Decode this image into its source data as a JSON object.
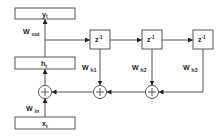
{
  "diagram": {
    "title": "",
    "nodes": {
      "output": {
        "label": "y",
        "sub": "t"
      },
      "hidden": {
        "label": "h",
        "sub": "t"
      },
      "input": {
        "label": "x",
        "sub": "t"
      },
      "delay1": {
        "label": "z",
        "sup": "-1"
      },
      "delay2": {
        "label": "z",
        "sup": "-1"
      },
      "delay3": {
        "label": "z",
        "sup": "-1"
      },
      "sum1": {
        "label": "+"
      },
      "sum2": {
        "label": "+"
      },
      "sum3": {
        "label": "+"
      }
    },
    "weights": {
      "out": {
        "label": "W",
        "sub": "out"
      },
      "in": {
        "label": "W",
        "sub": "in"
      },
      "h1": {
        "label": "W",
        "sub": "h1"
      },
      "h2": {
        "label": "W",
        "sub": "h2"
      },
      "h3": {
        "label": "W",
        "sub": "h3"
      }
    },
    "colors": {
      "stroke": "#555555",
      "text": "#222222",
      "background": "#ffffff"
    }
  }
}
